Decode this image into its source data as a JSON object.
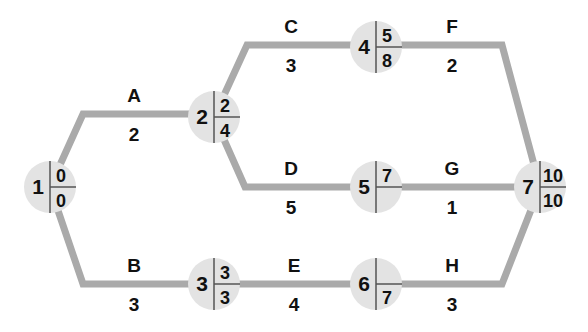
{
  "colors": {
    "edge": "#aaaaaa",
    "node_fill": "#e3e3e3",
    "text": "#111111"
  },
  "nodes": [
    {
      "id": "1",
      "earliest": "0",
      "latest": "0"
    },
    {
      "id": "2",
      "earliest": "2",
      "latest": "4"
    },
    {
      "id": "3",
      "earliest": "3",
      "latest": "3"
    },
    {
      "id": "4",
      "earliest": "5",
      "latest": "8"
    },
    {
      "id": "5",
      "earliest": "7",
      "latest": ""
    },
    {
      "id": "6",
      "earliest": "",
      "latest": "7"
    },
    {
      "id": "7",
      "earliest": "10",
      "latest": "10"
    }
  ],
  "activities": [
    {
      "name": "A",
      "duration": "2",
      "from": "1",
      "to": "2"
    },
    {
      "name": "B",
      "duration": "3",
      "from": "1",
      "to": "3"
    },
    {
      "name": "C",
      "duration": "3",
      "from": "2",
      "to": "4"
    },
    {
      "name": "D",
      "duration": "5",
      "from": "2",
      "to": "5"
    },
    {
      "name": "E",
      "duration": "4",
      "from": "3",
      "to": "6"
    },
    {
      "name": "F",
      "duration": "2",
      "from": "4",
      "to": "7"
    },
    {
      "name": "G",
      "duration": "1",
      "from": "5",
      "to": "7"
    },
    {
      "name": "H",
      "duration": "3",
      "from": "6",
      "to": "7"
    }
  ]
}
